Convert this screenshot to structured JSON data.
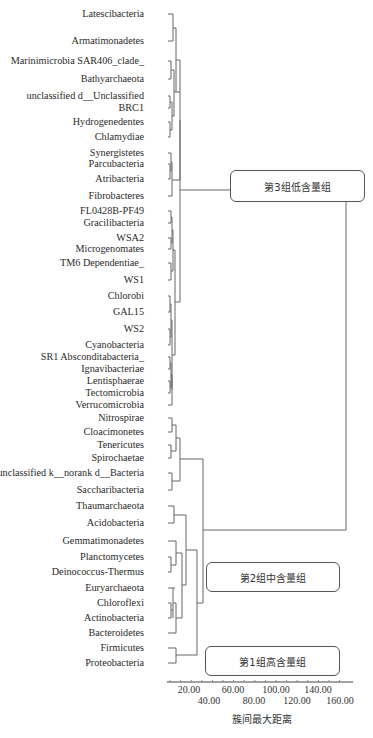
{
  "chart_data": {
    "type": "dendrogram",
    "title": "",
    "xlabel": "簇间最大距离",
    "ylabel": "",
    "xlim": [
      0,
      170
    ],
    "x_ticks": [
      20,
      40,
      60,
      80,
      100,
      120,
      140,
      160
    ],
    "x_tick_labels": [
      "20.00",
      "40.00",
      "60.00",
      "80.00",
      "100.00",
      "120.00",
      "140.00",
      "160.00"
    ],
    "leaves": [
      {
        "name": "Latescibacteria",
        "y": 14
      },
      {
        "name": "Armatimonadetes",
        "y": 41
      },
      {
        "name": "Marinimicrobia SAR406_clade_",
        "y": 61
      },
      {
        "name": "Bathyarchaeota",
        "y": 79
      },
      {
        "name": "unclassified d__Unclassified",
        "y": 96
      },
      {
        "name": "BRC1",
        "y": 108
      },
      {
        "name": "Hydrogenedentes",
        "y": 122
      },
      {
        "name": "Chlamydiae",
        "y": 137
      },
      {
        "name": "Synergistetes",
        "y": 153
      },
      {
        "name": "Parcubacteria",
        "y": 164
      },
      {
        "name": "Atribacteria",
        "y": 179
      },
      {
        "name": "Fibrobacteres",
        "y": 196
      },
      {
        "name": "FL0428B-PF49",
        "y": 211
      },
      {
        "name": "Gracilibacteria",
        "y": 223
      },
      {
        "name": "WSA2",
        "y": 238
      },
      {
        "name": "Microgenomates",
        "y": 249
      },
      {
        "name": "TM6 Dependentiae_",
        "y": 263
      },
      {
        "name": "WS1",
        "y": 280
      },
      {
        "name": "Chlorobi",
        "y": 296
      },
      {
        "name": "GAL15",
        "y": 312
      },
      {
        "name": "WS2",
        "y": 329
      },
      {
        "name": "Cyanobacteria",
        "y": 345
      },
      {
        "name": "SR1 Absconditabacteria_",
        "y": 357
      },
      {
        "name": "Ignavibacteriae",
        "y": 369
      },
      {
        "name": "Lentisphaerae",
        "y": 381
      },
      {
        "name": "Tectomicrobia",
        "y": 393
      },
      {
        "name": "Verrucomicrobia",
        "y": 405
      },
      {
        "name": "Nitrospirae",
        "y": 418
      },
      {
        "name": "Cloacimonetes",
        "y": 432
      },
      {
        "name": "Tenericutes",
        "y": 445
      },
      {
        "name": "Spirochaetae",
        "y": 458
      },
      {
        "name": "unclassified k__norank d__Bacteria",
        "y": 473
      },
      {
        "name": "Saccharibacteria",
        "y": 490
      },
      {
        "name": "Thaumarchaeota",
        "y": 506
      },
      {
        "name": "Acidobacteria",
        "y": 523
      },
      {
        "name": "Gemmatimonadetes",
        "y": 541
      },
      {
        "name": "Planctomycetes",
        "y": 557
      },
      {
        "name": "Deinococcus-Thermus",
        "y": 572
      },
      {
        "name": "Euryarchaeota",
        "y": 588
      },
      {
        "name": "Chloroflexi",
        "y": 603
      },
      {
        "name": "Actinobacteria",
        "y": 618
      },
      {
        "name": "Bacteroidetes",
        "y": 633
      },
      {
        "name": "Firmicutes",
        "y": 648
      },
      {
        "name": "Proteobacteria",
        "y": 663
      }
    ],
    "groups": [
      {
        "label": "第3组低含量组",
        "members_range": [
          "Latescibacteria",
          "Verrucomicrobia"
        ]
      },
      {
        "label": "第2组中含量组",
        "members_range": [
          "Nitrospirae",
          "Bacteroidetes"
        ]
      },
      {
        "label": "第1组高含量组",
        "members_range": [
          "Firmicutes",
          "Proteobacteria"
        ]
      }
    ],
    "segments": [
      [
        168,
        14,
        173,
        14
      ],
      [
        168,
        41,
        173,
        41
      ],
      [
        173,
        14,
        173,
        41
      ],
      [
        173,
        28,
        176,
        28
      ],
      [
        168,
        61,
        171,
        61
      ],
      [
        168,
        79,
        171,
        79
      ],
      [
        171,
        61,
        171,
        79
      ],
      [
        171,
        70,
        174,
        70
      ],
      [
        168,
        96,
        170,
        96
      ],
      [
        168,
        108,
        170,
        108
      ],
      [
        170,
        96,
        170,
        108
      ],
      [
        170,
        102,
        172,
        102
      ],
      [
        168,
        122,
        170,
        122
      ],
      [
        168,
        137,
        170,
        137
      ],
      [
        170,
        122,
        170,
        137
      ],
      [
        170,
        130,
        172,
        130
      ],
      [
        172,
        102,
        172,
        130
      ],
      [
        172,
        116,
        174,
        116
      ],
      [
        174,
        70,
        174,
        116
      ],
      [
        174,
        92,
        176,
        92
      ],
      [
        176,
        28,
        176,
        92
      ],
      [
        176,
        60,
        180,
        60
      ],
      [
        168,
        153,
        171,
        153
      ],
      [
        168,
        164,
        170,
        164
      ],
      [
        168,
        179,
        170,
        179
      ],
      [
        170,
        164,
        170,
        179
      ],
      [
        170,
        171,
        171,
        171
      ],
      [
        171,
        153,
        171,
        171
      ],
      [
        171,
        162,
        172,
        162
      ],
      [
        168,
        196,
        172,
        196
      ],
      [
        172,
        162,
        172,
        196
      ],
      [
        172,
        180,
        180,
        180
      ],
      [
        180,
        60,
        180,
        180
      ],
      [
        180,
        92,
        180,
        92
      ],
      [
        168,
        211,
        171,
        211
      ],
      [
        168,
        223,
        171,
        223
      ],
      [
        171,
        211,
        171,
        223
      ],
      [
        171,
        217,
        172,
        217
      ],
      [
        168,
        238,
        171,
        238
      ],
      [
        168,
        249,
        171,
        249
      ],
      [
        171,
        238,
        171,
        249
      ],
      [
        171,
        243,
        172,
        243
      ],
      [
        172,
        217,
        172,
        243
      ],
      [
        172,
        230,
        173,
        230
      ],
      [
        168,
        263,
        171,
        263
      ],
      [
        168,
        280,
        171,
        280
      ],
      [
        171,
        263,
        171,
        280
      ],
      [
        171,
        271,
        173,
        271
      ],
      [
        173,
        230,
        173,
        271
      ],
      [
        173,
        250,
        175,
        250
      ],
      [
        168,
        296,
        170,
        296
      ],
      [
        168,
        312,
        170,
        312
      ],
      [
        170,
        296,
        170,
        312
      ],
      [
        170,
        304,
        171,
        304
      ],
      [
        168,
        329,
        170,
        329
      ],
      [
        168,
        345,
        170,
        345
      ],
      [
        170,
        329,
        170,
        345
      ],
      [
        170,
        337,
        171,
        337
      ],
      [
        171,
        304,
        171,
        337
      ],
      [
        171,
        320,
        172,
        320
      ],
      [
        168,
        357,
        170,
        357
      ],
      [
        168,
        369,
        170,
        369
      ],
      [
        170,
        357,
        170,
        369
      ],
      [
        170,
        363,
        171,
        363
      ],
      [
        168,
        381,
        170,
        381
      ],
      [
        168,
        393,
        170,
        393
      ],
      [
        170,
        381,
        170,
        393
      ],
      [
        170,
        387,
        171,
        387
      ],
      [
        171,
        363,
        171,
        387
      ],
      [
        171,
        375,
        171,
        375
      ],
      [
        168,
        405,
        172,
        405
      ],
      [
        171,
        375,
        172,
        375
      ],
      [
        172,
        375,
        172,
        405
      ],
      [
        172,
        390,
        172,
        390
      ],
      [
        172,
        320,
        172,
        390
      ],
      [
        172,
        355,
        175,
        355
      ],
      [
        175,
        250,
        175,
        355
      ],
      [
        175,
        302,
        180,
        302
      ],
      [
        180,
        120,
        180,
        302
      ],
      [
        180,
        190,
        182,
        190
      ],
      [
        176,
        92,
        180,
        92
      ],
      [
        182,
        195,
        182,
        195
      ],
      [
        168,
        418,
        172,
        418
      ],
      [
        168,
        432,
        172,
        432
      ],
      [
        172,
        418,
        172,
        432
      ],
      [
        172,
        425,
        176,
        425
      ],
      [
        168,
        445,
        171,
        445
      ],
      [
        168,
        458,
        171,
        458
      ],
      [
        171,
        445,
        171,
        458
      ],
      [
        171,
        451,
        176,
        451
      ],
      [
        176,
        425,
        176,
        451
      ],
      [
        176,
        438,
        180,
        438
      ],
      [
        168,
        473,
        172,
        473
      ],
      [
        168,
        490,
        172,
        490
      ],
      [
        172,
        473,
        172,
        490
      ],
      [
        172,
        481,
        180,
        481
      ],
      [
        180,
        438,
        180,
        481
      ],
      [
        180,
        459,
        203,
        459
      ],
      [
        168,
        506,
        174,
        506
      ],
      [
        168,
        523,
        174,
        523
      ],
      [
        174,
        506,
        174,
        523
      ],
      [
        174,
        515,
        186,
        515
      ],
      [
        168,
        541,
        176,
        541
      ],
      [
        168,
        557,
        171,
        557
      ],
      [
        168,
        572,
        171,
        572
      ],
      [
        171,
        557,
        171,
        572
      ],
      [
        171,
        565,
        176,
        565
      ],
      [
        176,
        541,
        176,
        565
      ],
      [
        176,
        553,
        182,
        553
      ],
      [
        168,
        588,
        175,
        588
      ],
      [
        168,
        603,
        171,
        603
      ],
      [
        168,
        618,
        171,
        618
      ],
      [
        171,
        603,
        171,
        618
      ],
      [
        171,
        610,
        173,
        610
      ],
      [
        173,
        588,
        173,
        618
      ],
      [
        173,
        603,
        176,
        603
      ],
      [
        168,
        633,
        176,
        633
      ],
      [
        176,
        603,
        176,
        633
      ],
      [
        176,
        618,
        182,
        618
      ],
      [
        182,
        553,
        182,
        618
      ],
      [
        182,
        585,
        186,
        585
      ],
      [
        186,
        515,
        186,
        585
      ],
      [
        186,
        550,
        197,
        550
      ],
      [
        168,
        648,
        176,
        648
      ],
      [
        168,
        663,
        176,
        663
      ],
      [
        176,
        648,
        176,
        663
      ],
      [
        176,
        655,
        197,
        655
      ],
      [
        197,
        550,
        197,
        655
      ],
      [
        197,
        603,
        203,
        603
      ],
      [
        203,
        459,
        203,
        603
      ],
      [
        203,
        530,
        346,
        530
      ],
      [
        182,
        190,
        232,
        190
      ],
      [
        346,
        195,
        346,
        530
      ]
    ]
  },
  "axis": {
    "ticks": [
      {
        "label": "20.00",
        "x": 189,
        "row": 0
      },
      {
        "label": "40.00",
        "x": 209,
        "row": 1
      },
      {
        "label": "60.00",
        "x": 233,
        "row": 0
      },
      {
        "label": "80.00",
        "x": 254,
        "row": 1
      },
      {
        "label": "100.00",
        "x": 276,
        "row": 0
      },
      {
        "label": "120.00",
        "x": 297,
        "row": 1
      },
      {
        "label": "140.00",
        "x": 318,
        "row": 0
      },
      {
        "label": "160.00",
        "x": 340,
        "row": 1
      }
    ],
    "title": "簇间最大距离"
  },
  "group_boxes": [
    {
      "label": "第3组低含量组",
      "x": 230,
      "y": 170,
      "w": 133,
      "h": 30
    },
    {
      "label": "第2组中含量组",
      "x": 206,
      "y": 562,
      "w": 132,
      "h": 28
    },
    {
      "label": "第1组高含量组",
      "x": 205,
      "y": 646,
      "w": 133,
      "h": 28
    }
  ]
}
